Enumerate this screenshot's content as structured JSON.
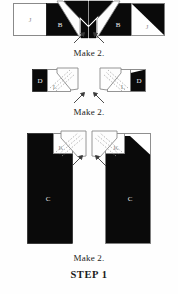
{
  "diagram": {
    "title": "STEP 1",
    "step_label": "STEP 1",
    "colors": {
      "dark_fabric": "#0a0a0a",
      "light_fabric": "#ffffff",
      "paper": "#fefefe",
      "outline": "#8a8a8a",
      "dash_line": "#9a9a9a",
      "text": "#232323",
      "label_on_dark": "#efefef",
      "label_on_light": "#8e8e8e"
    },
    "rows": [
      {
        "name": "row-1-flying-geese",
        "caption": "Make 2.",
        "units": [
          {
            "name": "unit-1-left",
            "mirror": false,
            "pieces": [
              {
                "label": "J",
                "fabric": "light",
                "shape": "rectangle"
              },
              {
                "label": "B",
                "fabric": "dark",
                "shape": "square-with-folded-light-triangle"
              }
            ]
          },
          {
            "name": "unit-1-right",
            "mirror": true,
            "pieces": [
              {
                "label": "B",
                "fabric": "dark",
                "shape": "square-with-folded-light-triangle"
              },
              {
                "label": "J",
                "fabric": "light",
                "shape": "rectangle"
              }
            ]
          }
        ]
      },
      {
        "name": "row-2-corner-units",
        "caption": "Make 2.",
        "units": [
          {
            "name": "unit-2-left",
            "mirror": false,
            "pieces": [
              {
                "label": "D",
                "fabric": "dark",
                "shape": "square"
              },
              {
                "label": "L",
                "fabric": "light",
                "shape": "square-with-folded-flap"
              }
            ]
          },
          {
            "name": "unit-2-right",
            "mirror": true,
            "pieces": [
              {
                "label": "L",
                "fabric": "light",
                "shape": "square-with-folded-flap"
              },
              {
                "label": "D",
                "fabric": "dark",
                "shape": "square-with-dark-triangle"
              }
            ]
          }
        ]
      },
      {
        "name": "row-3-long-units",
        "caption": "Make 2.",
        "units": [
          {
            "name": "unit-3-left",
            "mirror": false,
            "pieces": [
              {
                "label": "C",
                "fabric": "dark",
                "shape": "tall-rectangle"
              },
              {
                "label": "K",
                "fabric": "light",
                "shape": "corner-square-with-folded-flap"
              }
            ]
          },
          {
            "name": "unit-3-right",
            "mirror": true,
            "pieces": [
              {
                "label": "K",
                "fabric": "light",
                "shape": "corner-square-with-folded-flap"
              },
              {
                "label": "C",
                "fabric": "dark",
                "shape": "tall-rectangle"
              }
            ]
          }
        ]
      }
    ],
    "arrow_pairs": [
      {
        "name": "arrow-pair-row-1",
        "count": 2,
        "direction": "inward-down"
      },
      {
        "name": "arrow-pair-row-2",
        "count": 2,
        "direction": "inward-down"
      },
      {
        "name": "arrow-pair-row-3",
        "count": 2,
        "direction": "inward-down"
      }
    ],
    "captions": {
      "row1": "Make 2.",
      "row2": "Make 2.",
      "row3": "Make 2."
    }
  }
}
